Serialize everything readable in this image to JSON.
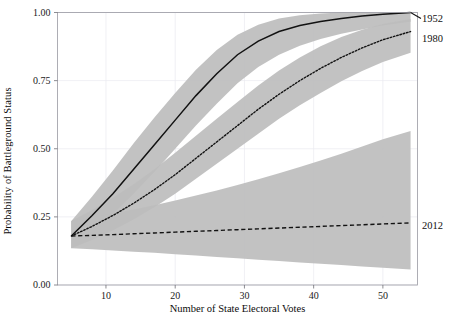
{
  "figure": {
    "axis_color": "#9a9aa2",
    "grid_color": "#e9e9ef",
    "band_color": "#bdbdbd",
    "line_color": "#121212"
  },
  "axes": {
    "xlabel": "Number of State Electoral Votes",
    "ylabel": "Probability of Battleground Status",
    "xticks": [
      "10",
      "20",
      "30",
      "40",
      "50"
    ],
    "yticks": [
      "0.00",
      "0.25",
      "0.50",
      "0.75",
      "1.00"
    ]
  },
  "series_labels": {
    "s1952": "1952",
    "s1980": "1980",
    "s2012": "2012"
  },
  "chart_data": {
    "type": "line",
    "title": "",
    "xlabel": "Number of State Electoral Votes",
    "ylabel": "Probability of Battleground Status",
    "xlim": [
      3,
      55
    ],
    "ylim": [
      0.0,
      1.0
    ],
    "xticks": [
      10,
      20,
      30,
      40,
      50
    ],
    "yticks": [
      0.0,
      0.25,
      0.5,
      0.75,
      1.0
    ],
    "grid": true,
    "legend": "right-edge-inline-labels",
    "x": [
      5,
      8,
      11,
      14,
      17,
      20,
      23,
      26,
      29,
      32,
      35,
      38,
      41,
      44,
      47,
      50,
      54
    ],
    "series": [
      {
        "name": "1952",
        "style": "solid",
        "values": [
          0.18,
          0.255,
          0.335,
          0.425,
          0.515,
          0.605,
          0.695,
          0.775,
          0.845,
          0.895,
          0.93,
          0.952,
          0.967,
          0.978,
          0.987,
          0.994,
          1.0
        ],
        "band_lower": [
          0.135,
          0.195,
          0.26,
          0.335,
          0.415,
          0.5,
          0.585,
          0.665,
          0.74,
          0.8,
          0.845,
          0.878,
          0.903,
          0.922,
          0.938,
          0.952,
          0.966
        ],
        "band_upper": [
          0.235,
          0.325,
          0.42,
          0.52,
          0.615,
          0.705,
          0.79,
          0.862,
          0.918,
          0.955,
          0.978,
          0.99,
          0.996,
          1.0,
          1.0,
          1.0,
          1.0
        ]
      },
      {
        "name": "1980",
        "style": "dotted",
        "values": [
          0.18,
          0.215,
          0.255,
          0.3,
          0.35,
          0.405,
          0.465,
          0.525,
          0.585,
          0.645,
          0.7,
          0.75,
          0.795,
          0.835,
          0.87,
          0.9,
          0.93
        ],
        "band_lower": [
          0.135,
          0.165,
          0.2,
          0.24,
          0.285,
          0.335,
          0.39,
          0.445,
          0.5,
          0.555,
          0.61,
          0.66,
          0.705,
          0.748,
          0.785,
          0.818,
          0.852
        ],
        "band_upper": [
          0.235,
          0.275,
          0.32,
          0.37,
          0.425,
          0.485,
          0.548,
          0.61,
          0.672,
          0.732,
          0.787,
          0.835,
          0.876,
          0.91,
          0.937,
          0.958,
          0.976
        ]
      },
      {
        "name": "2012",
        "style": "dashed",
        "values": [
          0.18,
          0.182,
          0.185,
          0.188,
          0.191,
          0.194,
          0.197,
          0.2,
          0.203,
          0.206,
          0.209,
          0.212,
          0.215,
          0.218,
          0.221,
          0.224,
          0.228
        ],
        "band_lower": [
          0.135,
          0.131,
          0.127,
          0.122,
          0.118,
          0.113,
          0.108,
          0.103,
          0.098,
          0.093,
          0.088,
          0.083,
          0.078,
          0.073,
          0.068,
          0.063,
          0.057
        ],
        "band_upper": [
          0.235,
          0.248,
          0.262,
          0.277,
          0.293,
          0.31,
          0.328,
          0.347,
          0.367,
          0.388,
          0.41,
          0.433,
          0.457,
          0.482,
          0.508,
          0.535,
          0.565
        ]
      }
    ]
  }
}
